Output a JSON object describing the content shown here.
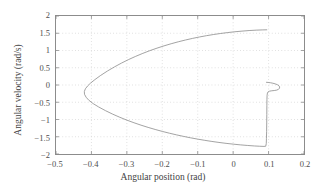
{
  "chart_data": {
    "type": "line",
    "title": "",
    "xlabel": "Angular position (rad)",
    "ylabel": "Angular velocity (rad/s)",
    "xlim": [
      -0.5,
      0.2
    ],
    "ylim": [
      -2,
      2
    ],
    "xticks": [
      -0.5,
      -0.4,
      -0.3,
      -0.2,
      -0.1,
      0,
      0.1,
      0.2
    ],
    "xticklabels": [
      "−0.5",
      "−0.4",
      "−0.3",
      "−0.2",
      "−0.1",
      "0",
      "0.1",
      "0.2"
    ],
    "yticks": [
      2,
      1.5,
      1,
      0.5,
      0,
      -0.5,
      -1,
      -1.5,
      -2
    ],
    "yticklabels": [
      "2",
      "1.5",
      "1",
      "0.5",
      "0",
      "−0.5",
      "−1",
      "−1.5",
      "−2"
    ],
    "grid": true,
    "grid_style": "dotted",
    "legend": null,
    "line_color": "#8a8a8a",
    "line_width": 0.8,
    "frame_color": "#8c8c8c",
    "grid_color": "#c9c9c9",
    "series": [
      {
        "name": "trajectory",
        "points": [
          [
            0.095,
            1.6
          ],
          [
            0.082,
            1.597
          ],
          [
            0.065,
            1.59
          ],
          [
            0.045,
            1.578
          ],
          [
            0.025,
            1.562
          ],
          [
            0.005,
            1.543
          ],
          [
            -0.015,
            1.52
          ],
          [
            -0.035,
            1.494
          ],
          [
            -0.055,
            1.464
          ],
          [
            -0.075,
            1.43
          ],
          [
            -0.095,
            1.392
          ],
          [
            -0.115,
            1.35
          ],
          [
            -0.135,
            1.303
          ],
          [
            -0.155,
            1.252
          ],
          [
            -0.175,
            1.196
          ],
          [
            -0.195,
            1.135
          ],
          [
            -0.215,
            1.068
          ],
          [
            -0.235,
            0.996
          ],
          [
            -0.255,
            0.917
          ],
          [
            -0.275,
            0.831
          ],
          [
            -0.295,
            0.738
          ],
          [
            -0.315,
            0.636
          ],
          [
            -0.335,
            0.525
          ],
          [
            -0.355,
            0.404
          ],
          [
            -0.375,
            0.27
          ],
          [
            -0.39,
            0.158
          ],
          [
            -0.402,
            0.06
          ],
          [
            -0.411,
            -0.03
          ],
          [
            -0.417,
            -0.11
          ],
          [
            -0.42,
            -0.19
          ],
          [
            -0.4195,
            -0.27
          ],
          [
            -0.415,
            -0.355
          ],
          [
            -0.407,
            -0.445
          ],
          [
            -0.395,
            -0.54
          ],
          [
            -0.38,
            -0.635
          ],
          [
            -0.36,
            -0.745
          ],
          [
            -0.34,
            -0.845
          ],
          [
            -0.32,
            -0.935
          ],
          [
            -0.3,
            -1.018
          ],
          [
            -0.28,
            -1.094
          ],
          [
            -0.26,
            -1.164
          ],
          [
            -0.24,
            -1.229
          ],
          [
            -0.22,
            -1.289
          ],
          [
            -0.2,
            -1.345
          ],
          [
            -0.18,
            -1.397
          ],
          [
            -0.16,
            -1.445
          ],
          [
            -0.14,
            -1.49
          ],
          [
            -0.12,
            -1.531
          ],
          [
            -0.1,
            -1.569
          ],
          [
            -0.08,
            -1.604
          ],
          [
            -0.06,
            -1.636
          ],
          [
            -0.04,
            -1.665
          ],
          [
            -0.02,
            -1.691
          ],
          [
            0.0,
            -1.714
          ],
          [
            0.02,
            -1.735
          ],
          [
            0.04,
            -1.752
          ],
          [
            0.06,
            -1.767
          ],
          [
            0.075,
            -1.775
          ],
          [
            0.087,
            -1.78
          ],
          [
            0.092,
            -1.775
          ],
          [
            0.0935,
            -1.7
          ],
          [
            0.094,
            -1.55
          ],
          [
            0.0945,
            -1.35
          ],
          [
            0.0948,
            -1.1
          ],
          [
            0.095,
            -0.85
          ],
          [
            0.0952,
            -0.6
          ],
          [
            0.0954,
            -0.42
          ],
          [
            0.0958,
            -0.3
          ],
          [
            0.0968,
            -0.232
          ],
          [
            0.099,
            -0.196
          ],
          [
            0.103,
            -0.178
          ],
          [
            0.109,
            -0.168
          ],
          [
            0.116,
            -0.16
          ],
          [
            0.123,
            -0.148
          ],
          [
            0.128,
            -0.125
          ],
          [
            0.1308,
            -0.092
          ],
          [
            0.1312,
            -0.056
          ],
          [
            0.1292,
            -0.022
          ],
          [
            0.125,
            0.008
          ],
          [
            0.119,
            0.032
          ],
          [
            0.112,
            0.052
          ],
          [
            0.105,
            0.066
          ],
          [
            0.099,
            0.074
          ],
          [
            0.094,
            0.078
          ]
        ]
      }
    ]
  }
}
